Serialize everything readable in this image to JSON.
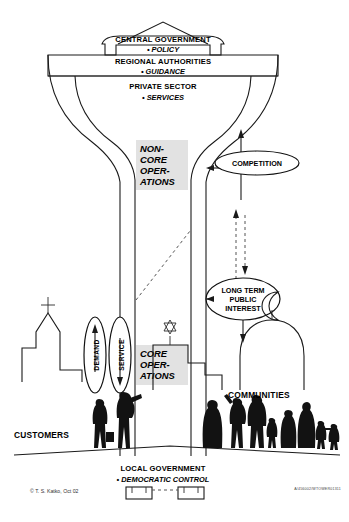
{
  "figure": {
    "title_internal": "Water services governance tower",
    "credit": "© T. S. Katko, Oct 02",
    "reference_code": "A/456002/WTOWER01311"
  },
  "tower": {
    "tiers": [
      {
        "id": "central-government",
        "label": "CENTRAL GOVERNMENT",
        "bullet": "• POLICY"
      },
      {
        "id": "regional-authorities",
        "label": "REGIONAL AUTHORITIES",
        "bullet": "• GUIDANCE"
      },
      {
        "id": "private-sector",
        "label": "PRIVATE SECTOR",
        "bullet": "• SERVICES"
      }
    ],
    "base": {
      "id": "local-government",
      "label": "LOCAL GOVERNMENT",
      "bullet": "• DEMOCRATIC CONTROL"
    },
    "shaft_blocks": [
      {
        "id": "non-core-operations",
        "lines": [
          "NON-",
          "CORE",
          "OPER-",
          "ATIONS"
        ]
      },
      {
        "id": "core-operations",
        "lines": [
          "CORE",
          "OPER-",
          "ATIONS"
        ]
      }
    ]
  },
  "ellipses": {
    "competition": {
      "label": "COMPETITION",
      "lines": [
        "COMPETITION"
      ]
    },
    "long_term_public_interest": {
      "label": "LONG TERM PUBLIC INTEREST",
      "lines": [
        "LONG TERM",
        "PUBLIC",
        "INTEREST"
      ]
    },
    "demand": {
      "label": "DEMAND",
      "arrow": "up"
    },
    "service": {
      "label": "SERVICE",
      "arrow": "down"
    }
  },
  "ground_labels": [
    {
      "id": "customers",
      "text": "CUSTOMERS"
    },
    {
      "id": "communities",
      "text": "COMMUNITIES"
    }
  ],
  "buildings": [
    {
      "id": "church",
      "icon": "cross-icon",
      "symbol": "cross"
    },
    {
      "id": "synagogue",
      "icon": "star-of-david-icon",
      "symbol": "star-of-david"
    },
    {
      "id": "mosque",
      "icon": "crescent-icon",
      "symbol": "crescent"
    }
  ],
  "colors": {
    "line": "#1a1a1a",
    "block_fill": "#e2e2e2",
    "silhouette": "#121212",
    "background": "#ffffff"
  }
}
